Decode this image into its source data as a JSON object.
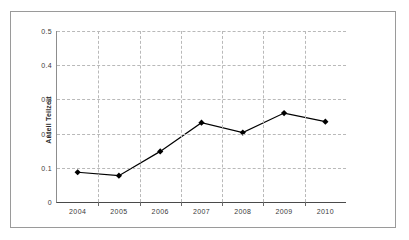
{
  "figure": {
    "frame_color": "#9a9a9a",
    "background": "#ffffff"
  },
  "chart_data": {
    "type": "line",
    "title": "",
    "subtitle": "",
    "xlabel": "",
    "ylabel": "Anteil Teilzeit",
    "categories": [
      "2004",
      "2005",
      "2006",
      "2007",
      "2008",
      "2009",
      "2010"
    ],
    "x": [
      2004,
      2005,
      2006,
      2007,
      2008,
      2009,
      2010
    ],
    "values": [
      0.087,
      0.077,
      0.148,
      0.232,
      0.203,
      0.26,
      0.235
    ],
    "series": [
      {
        "name": "Anteil Teilzeit",
        "values": [
          0.087,
          0.077,
          0.148,
          0.232,
          0.203,
          0.26,
          0.235
        ],
        "color": "#000000",
        "marker": "diamond"
      }
    ],
    "ylim": [
      0,
      0.5
    ],
    "yticks": [
      0,
      0.1,
      0.2,
      0.3,
      0.4,
      0.5
    ],
    "ytick_labels": [
      "0",
      "0.1",
      "0.2",
      "0.3",
      "0.4",
      "0.5"
    ],
    "xtick_labels": [
      "2004",
      "2005",
      "2006",
      "2007",
      "2008",
      "2009",
      "2010"
    ],
    "grid": true,
    "grid_style": "dashed",
    "grid_color": "#b9b9b9",
    "legend": false,
    "legend_position": "none",
    "line_color": "#000000",
    "marker_color": "#000000"
  }
}
